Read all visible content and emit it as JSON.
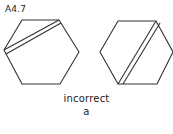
{
  "figure": {
    "label": "A4.7",
    "caption": "incorrect",
    "sublabel": "a",
    "stroke_color": "#333333"
  },
  "shapes": [
    {
      "name": "left-hexagon",
      "strip": "left vertex to top-right vertex"
    },
    {
      "name": "right-hexagon",
      "strip": "top-right vertex to bottom-left vertex"
    }
  ]
}
